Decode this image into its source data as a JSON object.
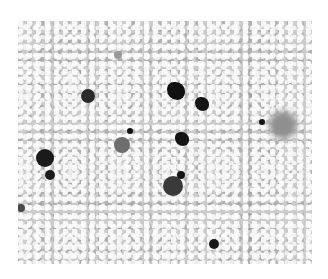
{
  "image": {
    "kind": "grayscale micrograph",
    "frame": {
      "x": 18,
      "y": 21,
      "width": 294,
      "height": 243
    },
    "background_color": "#c9c9c9",
    "particles": [
      {
        "label": "round-dark",
        "cx": 88,
        "cy": 96,
        "r": 7,
        "color": "#2a2a2a"
      },
      {
        "label": "irregular-black",
        "cx": 176,
        "cy": 91,
        "r": 9,
        "color": "#111111"
      },
      {
        "label": "irregular-black",
        "cx": 202,
        "cy": 104,
        "r": 7,
        "color": "#151515"
      },
      {
        "label": "irregular-black",
        "cx": 182,
        "cy": 139,
        "r": 7,
        "color": "#141414"
      },
      {
        "label": "large-dark",
        "cx": 45,
        "cy": 158,
        "r": 9,
        "color": "#1a1a1a"
      },
      {
        "label": "tail-dark",
        "cx": 50,
        "cy": 175,
        "r": 5,
        "color": "#1c1c1c"
      },
      {
        "label": "gray-round",
        "cx": 122,
        "cy": 145,
        "r": 8,
        "color": "#6e6e6e"
      },
      {
        "label": "small-black",
        "cx": 130,
        "cy": 131,
        "r": 3,
        "color": "#111111"
      },
      {
        "label": "large-dark",
        "cx": 173,
        "cy": 186,
        "r": 10,
        "color": "#3a3a3a"
      },
      {
        "label": "small-black",
        "cx": 181,
        "cy": 175,
        "r": 4,
        "color": "#151515"
      },
      {
        "label": "small-black",
        "cx": 214,
        "cy": 244,
        "r": 5,
        "color": "#1a1a1a"
      },
      {
        "label": "small-black",
        "cx": 262,
        "cy": 122,
        "r": 3,
        "color": "#151515"
      },
      {
        "label": "faint-halo",
        "cx": 283,
        "cy": 125,
        "r": 14,
        "color": "#8f8f8f"
      },
      {
        "label": "edge-dark",
        "cx": 21,
        "cy": 208,
        "r": 4,
        "color": "#4a4a4a"
      },
      {
        "label": "faint-gray",
        "cx": 118,
        "cy": 55,
        "r": 4,
        "color": "#9a9a9a"
      }
    ]
  }
}
